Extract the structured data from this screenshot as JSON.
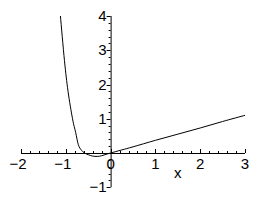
{
  "chart_data": {
    "type": "line",
    "title": "",
    "xlabel": "x",
    "ylabel": "",
    "xlim": [
      -2,
      3
    ],
    "ylim": [
      -1,
      4
    ],
    "x_ticks": [
      "-2",
      "-1",
      "0",
      "1",
      "2",
      "3"
    ],
    "y_ticks": [
      "-1",
      "1",
      "2",
      "3",
      "4"
    ],
    "grid": false,
    "legend": null,
    "series": [
      {
        "name": "f(x)",
        "color": "#000000",
        "points": [
          [
            -1.12,
            4.0
          ],
          [
            -1.03,
            2.7
          ],
          [
            -0.95,
            1.8
          ],
          [
            -0.85,
            1.0
          ],
          [
            -0.78,
            0.6
          ],
          [
            -0.72,
            0.24
          ],
          [
            -0.65,
            0.08
          ],
          [
            -0.58,
            0.0
          ],
          [
            -0.5,
            -0.05
          ],
          [
            -0.4,
            -0.09
          ],
          [
            -0.3,
            -0.1
          ],
          [
            -0.2,
            -0.08
          ],
          [
            -0.1,
            -0.04
          ],
          [
            0.0,
            0.0
          ],
          [
            0.25,
            0.09
          ],
          [
            0.5,
            0.18
          ],
          [
            1.0,
            0.37
          ],
          [
            1.5,
            0.55
          ],
          [
            2.0,
            0.73
          ],
          [
            2.5,
            0.92
          ],
          [
            3.0,
            1.1
          ]
        ]
      }
    ]
  },
  "labels": {
    "x_axis": "x",
    "x_ticks": [
      "-2",
      "-1",
      "0",
      "1",
      "2",
      "3"
    ],
    "y_ticks": [
      "4",
      "3",
      "2",
      "1",
      "-1"
    ]
  }
}
